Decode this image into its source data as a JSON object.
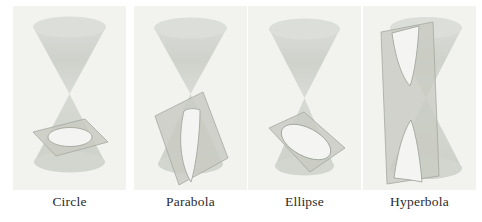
{
  "figure": {
    "panel_background": "#f2f2ef",
    "page_background": "#ffffff",
    "cone_fill": "#d6d8d2",
    "cone_fill_dark": "#c7cac3",
    "plane_fill": "#c9ccc4",
    "cut_fill": "#f4f5f2",
    "outline": "#9ea29a",
    "label_color": "#2b2b2b"
  },
  "panels": [
    {
      "id": "circle",
      "label": "Circle",
      "plane_orientation": "horizontal",
      "cut_shape": "circle",
      "description": "Double cone intersected by a plane perpendicular to the axis, producing a circle."
    },
    {
      "id": "parabola",
      "label": "Parabola",
      "plane_orientation": "parallel-to-slant",
      "cut_shape": "parabola",
      "description": "Double cone intersected by a plane parallel to a generating line, producing a parabola."
    },
    {
      "id": "ellipse",
      "label": "Ellipse",
      "plane_orientation": "oblique",
      "cut_shape": "ellipse",
      "description": "Double cone intersected by an oblique plane cutting one nappe, producing an ellipse."
    },
    {
      "id": "hyperbola",
      "label": "Hyperbola",
      "plane_orientation": "vertical",
      "cut_shape": "hyperbola",
      "description": "Double cone intersected by a near-vertical plane cutting both nappes, producing a hyperbola."
    }
  ]
}
